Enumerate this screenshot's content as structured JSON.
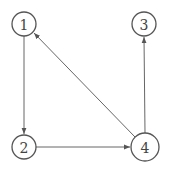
{
  "diagram": {
    "type": "directed-graph",
    "nodes": [
      {
        "id": "1",
        "label": "1",
        "x": 24,
        "y": 24,
        "r": 12
      },
      {
        "id": "2",
        "label": "2",
        "x": 24,
        "y": 147,
        "r": 12
      },
      {
        "id": "3",
        "label": "3",
        "x": 144,
        "y": 24,
        "r": 12
      },
      {
        "id": "4",
        "label": "4",
        "x": 145,
        "y": 147,
        "r": 14
      }
    ],
    "edges": [
      {
        "from": "1",
        "to": "2"
      },
      {
        "from": "2",
        "to": "4"
      },
      {
        "from": "4",
        "to": "3"
      },
      {
        "from": "4",
        "to": "1"
      }
    ],
    "colors": {
      "stroke": "#555555",
      "text": "#444444",
      "background": "#ffffff"
    }
  }
}
